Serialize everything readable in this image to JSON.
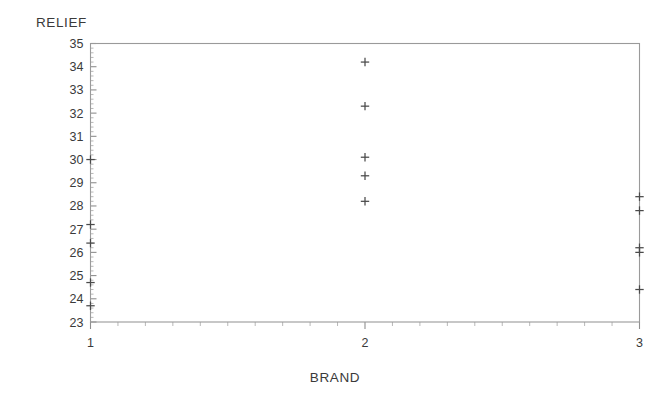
{
  "chart_data": {
    "type": "scatter",
    "title": "",
    "xlabel": "BRAND",
    "ylabel": "RELIEF",
    "xlim": [
      1,
      3
    ],
    "ylim": [
      23,
      35
    ],
    "grid": false,
    "legend": false,
    "marker": "plus",
    "x_tick_labels": [
      "1",
      "2",
      "3"
    ],
    "x_tick_values": [
      1,
      2,
      3
    ],
    "y_tick_labels": [
      "23",
      "24",
      "25",
      "26",
      "27",
      "28",
      "29",
      "30",
      "31",
      "32",
      "33",
      "34",
      "35"
    ],
    "y_tick_values": [
      23,
      24,
      25,
      26,
      27,
      28,
      29,
      30,
      31,
      32,
      33,
      34,
      35
    ],
    "categories": [
      "1",
      "2",
      "3"
    ],
    "series": [
      {
        "name": "BRAND 1",
        "x": [
          1,
          1,
          1,
          1,
          1
        ],
        "values": [
          30.0,
          27.2,
          26.4,
          24.7,
          23.7
        ]
      },
      {
        "name": "BRAND 2",
        "x": [
          2,
          2,
          2,
          2,
          2
        ],
        "values": [
          34.2,
          32.3,
          30.1,
          29.3,
          28.2
        ]
      },
      {
        "name": "BRAND 3",
        "x": [
          3,
          3,
          3,
          3,
          3
        ],
        "values": [
          28.4,
          27.8,
          26.2,
          26.0,
          24.4
        ]
      }
    ],
    "points": [
      {
        "x": 1,
        "y": 30.0
      },
      {
        "x": 1,
        "y": 27.2
      },
      {
        "x": 1,
        "y": 26.4
      },
      {
        "x": 1,
        "y": 24.7
      },
      {
        "x": 1,
        "y": 23.7
      },
      {
        "x": 2,
        "y": 34.2
      },
      {
        "x": 2,
        "y": 32.3
      },
      {
        "x": 2,
        "y": 30.1
      },
      {
        "x": 2,
        "y": 29.3
      },
      {
        "x": 2,
        "y": 28.2
      },
      {
        "x": 3,
        "y": 28.4
      },
      {
        "x": 3,
        "y": 27.8
      },
      {
        "x": 3,
        "y": 26.2
      },
      {
        "x": 3,
        "y": 26.0
      },
      {
        "x": 3,
        "y": 24.4
      }
    ],
    "axis_color": "#9a9a9a",
    "marker_color": "#4a4a4a",
    "text_color": "#3a3a3a"
  }
}
